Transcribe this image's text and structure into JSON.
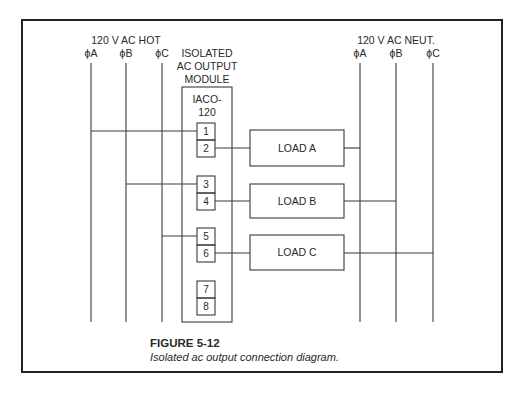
{
  "hot_bus": {
    "title": "120 V AC HOT",
    "phases": [
      "ϕA",
      "ϕB",
      "ϕC"
    ]
  },
  "neutral_bus": {
    "title": "120 V AC NEUT.",
    "phases": [
      "ϕA",
      "ϕB",
      "ϕC"
    ]
  },
  "module": {
    "label_lines": [
      "ISOLATED",
      "AC OUTPUT",
      "MODULE"
    ],
    "model_lines": [
      "IACO-",
      "120"
    ],
    "terminals": [
      "1",
      "2",
      "3",
      "4",
      "5",
      "6",
      "7",
      "8"
    ]
  },
  "loads": [
    "LOAD A",
    "LOAD B",
    "LOAD C"
  ],
  "caption": {
    "title": "FIGURE 5-12",
    "subtitle": "Isolated ac output connection diagram."
  }
}
